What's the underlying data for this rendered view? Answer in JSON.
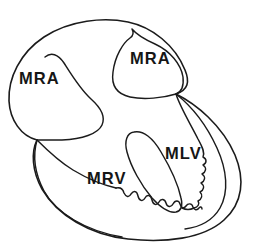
{
  "figure": {
    "background_color": "#ffffff",
    "stroke_color": "#1b1b1b",
    "width": 263,
    "height": 248
  },
  "labels": {
    "mra_left": "MRA",
    "mra_top": "MRA",
    "mlv": "MLV",
    "mrv": "MRV"
  },
  "structures": [
    {
      "name": "outer-heart-contour",
      "label": null,
      "description": "outer epicardial silhouette",
      "border": "smooth"
    },
    {
      "name": "left-atrium-chamber",
      "label": "MRA",
      "description": "left upper rounded chamber",
      "border": "smooth"
    },
    {
      "name": "upper-atrium-chamber",
      "label": "MRA",
      "description": "upper central teardrop chamber",
      "border": "smooth"
    },
    {
      "name": "left-ventricle-chamber",
      "label": "MLV",
      "description": "right lower chamber with trabeculated border",
      "border": "trabeculated"
    },
    {
      "name": "right-ventricle-chamber",
      "label": "MRV",
      "description": "lower central crescent chamber with trabeculated border",
      "border": "trabeculated"
    }
  ]
}
